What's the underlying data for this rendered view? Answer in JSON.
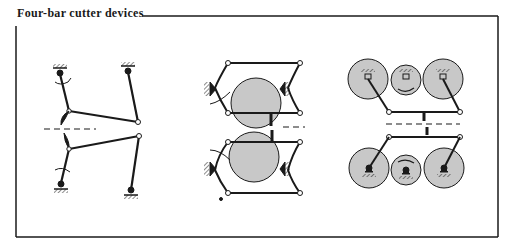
{
  "title": "Four-bar cutter devices",
  "colors": {
    "ink": "#1a1a1a",
    "disk_fill": "#c8c8c8",
    "background": "#ffffff"
  },
  "figures": [
    {
      "name": "simple-four-bar-linkage-pair",
      "description": "Two opposing four-bar linkages with cutter blades meeting at dashed cut line"
    },
    {
      "name": "four-bar-with-rotating-disks",
      "description": "Pair of four-bar linkages with large shaded disks and cutter blades"
    },
    {
      "name": "geared-four-bar-cutter",
      "description": "Gear-driven four-bar linkages with three shaded gears top and bottom, coupled cutter bars"
    }
  ]
}
